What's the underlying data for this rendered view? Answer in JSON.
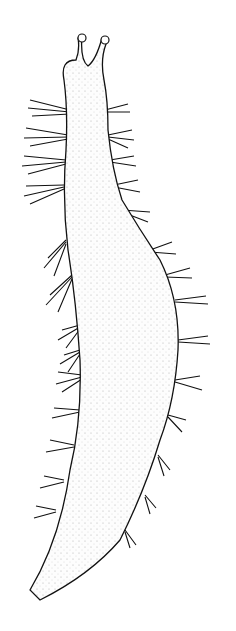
{
  "image": {
    "subject": "worm illustration",
    "style": "black ink line drawing with stipple shading",
    "background": "#ffffff",
    "ink": "#111111"
  }
}
